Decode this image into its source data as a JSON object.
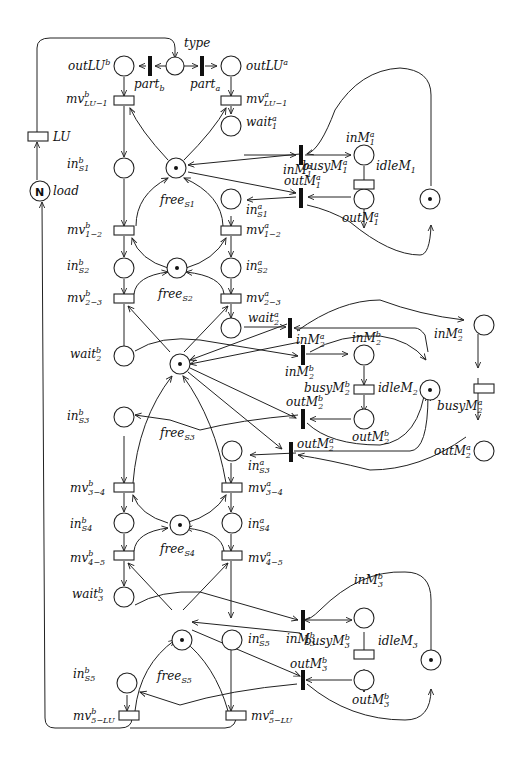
{
  "diagram": {
    "type": "petri-net",
    "places": [
      {
        "id": "type",
        "label": "type"
      },
      {
        "id": "outLUb",
        "label": "outLU",
        "sup": "b"
      },
      {
        "id": "outLUa",
        "label": "outLU",
        "sup": "a"
      },
      {
        "id": "load",
        "label": "load",
        "marking": "N"
      },
      {
        "id": "inS1b",
        "label": "in",
        "sup": "b",
        "sub": "S1"
      },
      {
        "id": "wait1a",
        "label": "wait",
        "sup": "a",
        "sub": "1"
      },
      {
        "id": "freeS1",
        "label": "free",
        "sub": "S1",
        "tokens": 1
      },
      {
        "id": "inM1a",
        "label": "inM",
        "sup": "a",
        "sub": "1"
      },
      {
        "id": "idleM1",
        "label": "idleM",
        "sub": "1",
        "tokens": 1
      },
      {
        "id": "outM1a",
        "label": "outM",
        "sup": "a",
        "sub": "1"
      },
      {
        "id": "inS1a",
        "label": "in",
        "sup": "a",
        "sub": "S1"
      },
      {
        "id": "inS2b",
        "label": "in",
        "sup": "b",
        "sub": "S2"
      },
      {
        "id": "freeS2",
        "label": "free",
        "sub": "S2",
        "tokens": 1
      },
      {
        "id": "inS2a",
        "label": "in",
        "sup": "a",
        "sub": "S2"
      },
      {
        "id": "wait2a",
        "label": "wait",
        "sup": "a",
        "sub": "2"
      },
      {
        "id": "wait2b",
        "label": "wait",
        "sup": "b",
        "sub": "2"
      },
      {
        "id": "inM2b",
        "label": "inM",
        "sup": "b",
        "sub": "2"
      },
      {
        "id": "idleM2",
        "label": "idleM",
        "sub": "2",
        "tokens": 1
      },
      {
        "id": "outM2b",
        "label": "outM",
        "sup": "b",
        "sub": "2"
      },
      {
        "id": "inM2a",
        "label": "inM",
        "sup": "a",
        "sub": "2"
      },
      {
        "id": "outM2a",
        "label": "outM",
        "sup": "a",
        "sub": "2"
      },
      {
        "id": "freeS3",
        "label": "free",
        "sub": "S3",
        "tokens": 1
      },
      {
        "id": "inS3b",
        "label": "in",
        "sup": "b",
        "sub": "S3"
      },
      {
        "id": "inS3a",
        "label": "in",
        "sup": "a",
        "sub": "S3"
      },
      {
        "id": "inS4b",
        "label": "in",
        "sup": "b",
        "sub": "S4"
      },
      {
        "id": "freeS4",
        "label": "free",
        "sub": "S4",
        "tokens": 1
      },
      {
        "id": "inS4a",
        "label": "in",
        "sup": "a",
        "sub": "S4"
      },
      {
        "id": "wait3b",
        "label": "wait",
        "sup": "b",
        "sub": "3"
      },
      {
        "id": "inM3b",
        "label": "inM",
        "sup": "b",
        "sub": "3"
      },
      {
        "id": "idleM3",
        "label": "idleM",
        "sub": "3",
        "tokens": 1
      },
      {
        "id": "outM3b",
        "label": "outM",
        "sup": "b",
        "sub": "3"
      },
      {
        "id": "freeS5",
        "label": "free",
        "sub": "S5",
        "tokens": 1
      },
      {
        "id": "inS5a",
        "label": "in",
        "sup": "a",
        "sub": "S5"
      },
      {
        "id": "inS5b",
        "label": "in",
        "sup": "b",
        "sub": "S5"
      }
    ],
    "transitions": [
      {
        "id": "partb",
        "label": "part",
        "sub": "b",
        "kind": "immediate"
      },
      {
        "id": "parta",
        "label": "part",
        "sub": "a",
        "kind": "immediate"
      },
      {
        "id": "LU",
        "label": "LU",
        "kind": "timed"
      },
      {
        "id": "mvLU1b",
        "label": "mv",
        "sup": "b",
        "sub": "LU−1",
        "kind": "timed"
      },
      {
        "id": "mvLU1a",
        "label": "mv",
        "sup": "a",
        "sub": "LU−1",
        "kind": "timed"
      },
      {
        "id": "tinM1a",
        "label": "inM",
        "sup": "a",
        "sub": "1",
        "kind": "immediate"
      },
      {
        "id": "busyM1a",
        "label": "busyM",
        "sup": "a",
        "sub": "1",
        "kind": "timed"
      },
      {
        "id": "toutM1a",
        "label": "outM",
        "sup": "a",
        "sub": "1",
        "kind": "immediate"
      },
      {
        "id": "mv12b",
        "label": "mv",
        "sup": "b",
        "sub": "1−2",
        "kind": "timed"
      },
      {
        "id": "mv12a",
        "label": "mv",
        "sup": "a",
        "sub": "1−2",
        "kind": "timed"
      },
      {
        "id": "mv23b",
        "label": "mv",
        "sup": "b",
        "sub": "2−3",
        "kind": "timed"
      },
      {
        "id": "mv23a",
        "label": "mv",
        "sup": "a",
        "sub": "2−3",
        "kind": "timed"
      },
      {
        "id": "tinM2a",
        "label": "inM",
        "sup": "a",
        "sub": "2",
        "kind": "immediate"
      },
      {
        "id": "tinM2b",
        "label": "inM",
        "sup": "b",
        "sub": "2",
        "kind": "immediate"
      },
      {
        "id": "busyM2b",
        "label": "busyM",
        "sup": "b",
        "sub": "2",
        "kind": "timed"
      },
      {
        "id": "busyM2a",
        "label": "busyM",
        "sup": "a",
        "sub": "2",
        "kind": "timed"
      },
      {
        "id": "toutM2b",
        "label": "outM",
        "sup": "b",
        "sub": "2",
        "kind": "immediate"
      },
      {
        "id": "toutM2a",
        "label": "outM",
        "sup": "a",
        "sub": "2",
        "kind": "immediate"
      },
      {
        "id": "mv34b",
        "label": "mv",
        "sup": "b",
        "sub": "3−4",
        "kind": "timed"
      },
      {
        "id": "mv34a",
        "label": "mv",
        "sup": "a",
        "sub": "3−4",
        "kind": "timed"
      },
      {
        "id": "mv45b",
        "label": "mv",
        "sup": "b",
        "sub": "4−5",
        "kind": "timed"
      },
      {
        "id": "mv45a",
        "label": "mv",
        "sup": "a",
        "sub": "4−5",
        "kind": "timed"
      },
      {
        "id": "tinM3b",
        "label": "inM",
        "sup": "b",
        "sub": "3",
        "kind": "immediate"
      },
      {
        "id": "busyM3b",
        "label": "busyM",
        "sup": "b",
        "sub": "3",
        "kind": "timed"
      },
      {
        "id": "toutM3b",
        "label": "outM",
        "sup": "b",
        "sub": "3",
        "kind": "immediate"
      },
      {
        "id": "mv5LUb",
        "label": "mv",
        "sup": "b",
        "sub": "5−LU",
        "kind": "timed"
      },
      {
        "id": "mv5LUa",
        "label": "mv",
        "sup": "a",
        "sub": "5−LU",
        "kind": "timed"
      }
    ],
    "load_marking": "N"
  }
}
